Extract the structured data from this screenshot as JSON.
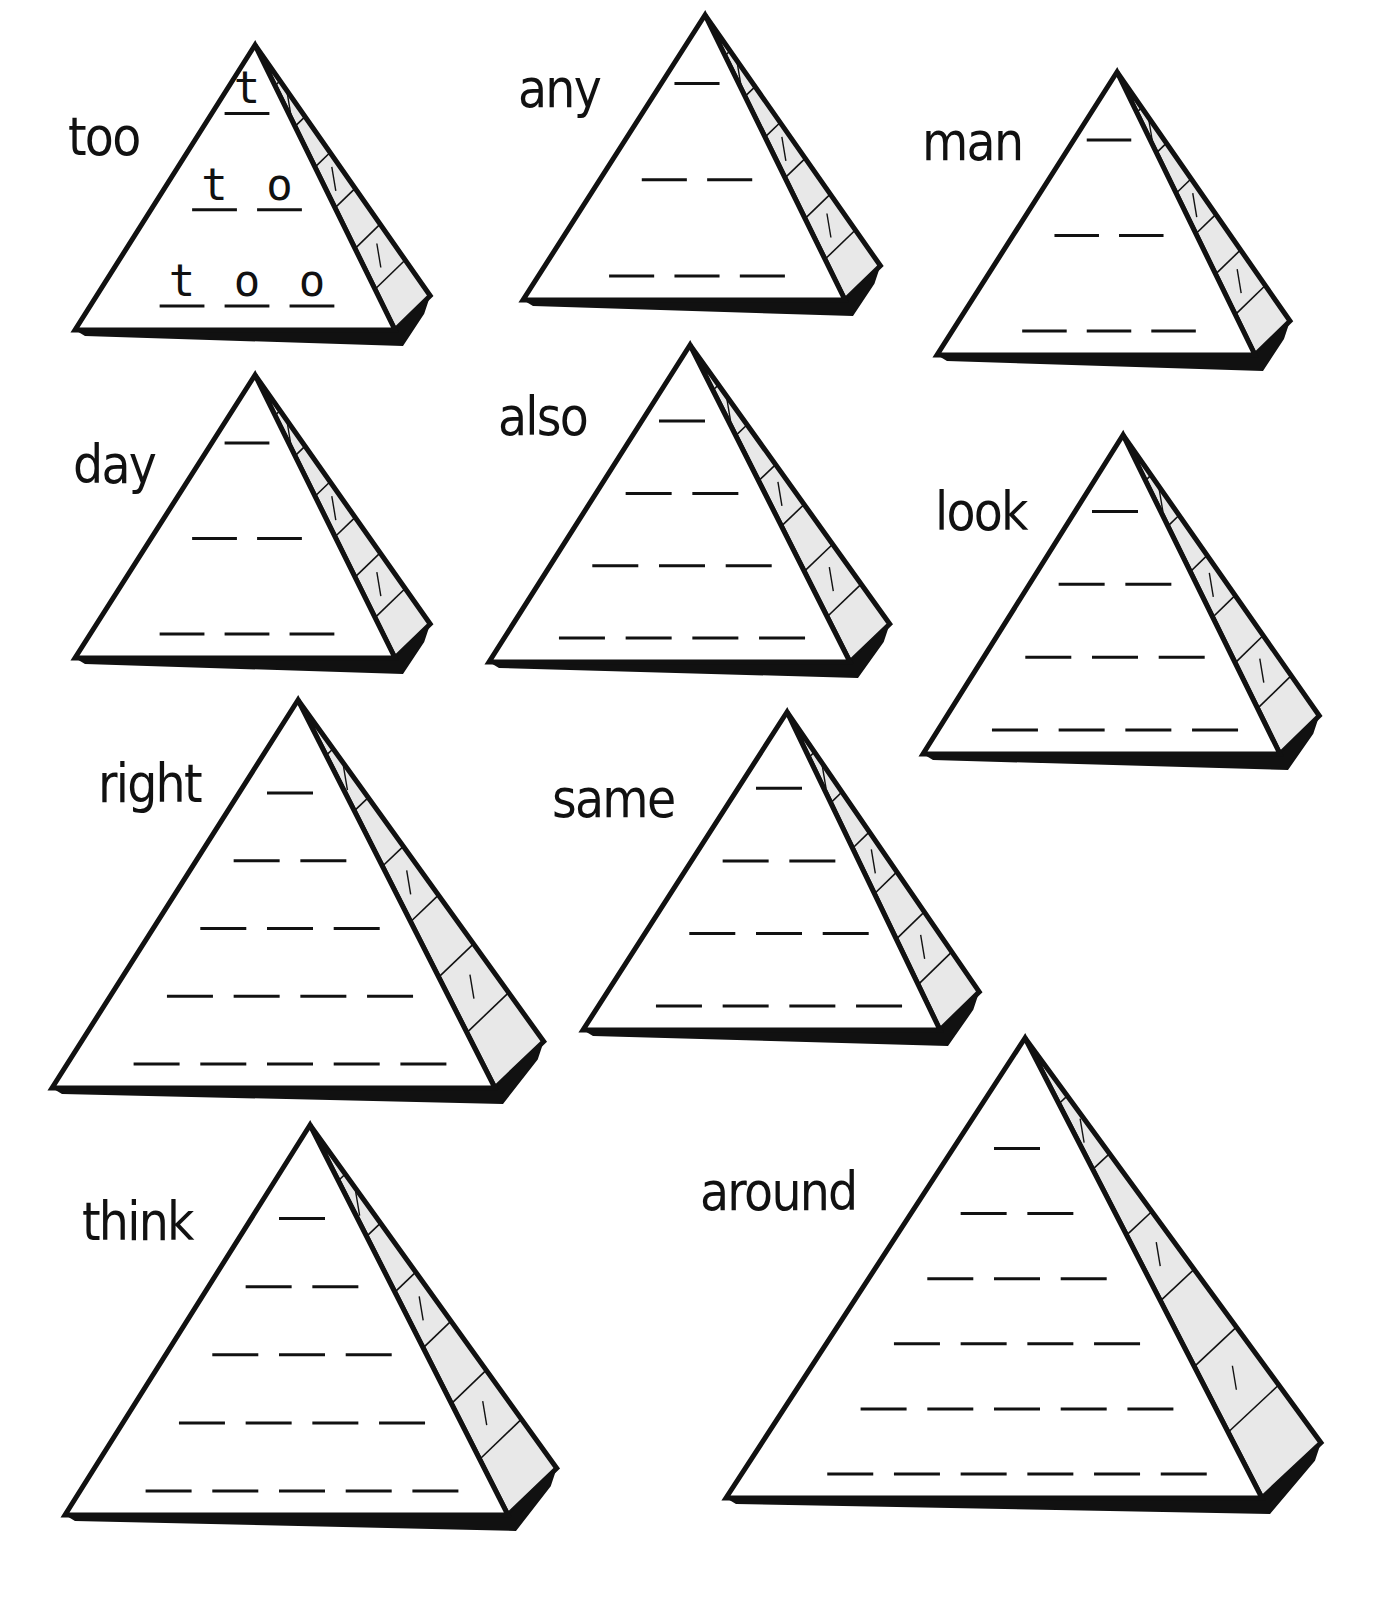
{
  "worksheet": {
    "pyramids": [
      {
        "word": "too",
        "rows": 3,
        "example": [
          [
            "t"
          ],
          [
            "t",
            "o"
          ],
          [
            "t",
            "o",
            "o"
          ]
        ],
        "apex": [
          255,
          45
        ],
        "base_left": [
          75,
          330
        ],
        "base_right": [
          395,
          330
        ],
        "scale": 1,
        "label_pos": [
          68,
          110
        ]
      },
      {
        "word": "any",
        "rows": 3,
        "apex": [
          705,
          15
        ],
        "base_left": [
          523,
          300
        ],
        "base_right": [
          845,
          300
        ],
        "label_pos": [
          518,
          62
        ]
      },
      {
        "word": "man",
        "rows": 3,
        "apex": [
          1117,
          72
        ],
        "base_left": [
          937,
          355
        ],
        "base_right": [
          1255,
          355
        ],
        "label_pos": [
          922,
          115
        ]
      },
      {
        "word": "day",
        "rows": 3,
        "apex": [
          255,
          375
        ],
        "base_left": [
          75,
          658
        ],
        "base_right": [
          395,
          658
        ],
        "label_pos": [
          73,
          438
        ]
      },
      {
        "word": "also",
        "rows": 4,
        "apex": [
          690,
          345
        ],
        "base_left": [
          489,
          662
        ],
        "base_right": [
          850,
          662
        ],
        "label_pos": [
          498,
          390
        ]
      },
      {
        "word": "look",
        "rows": 4,
        "apex": [
          1123,
          435
        ],
        "base_left": [
          923,
          754
        ],
        "base_right": [
          1280,
          754
        ],
        "label_pos": [
          935,
          485
        ]
      },
      {
        "word": "right",
        "rows": 5,
        "apex": [
          298,
          700
        ],
        "base_left": [
          52,
          1088
        ],
        "base_right": [
          495,
          1088
        ],
        "label_pos": [
          98,
          757
        ]
      },
      {
        "word": "same",
        "rows": 4,
        "apex": [
          787,
          712
        ],
        "base_left": [
          583,
          1030
        ],
        "base_right": [
          940,
          1030
        ],
        "label_pos": [
          552,
          772
        ]
      },
      {
        "word": "think",
        "rows": 5,
        "apex": [
          310,
          1125
        ],
        "base_left": [
          65,
          1515
        ],
        "base_right": [
          508,
          1515
        ],
        "label_pos": [
          82,
          1195
        ]
      },
      {
        "word": "around",
        "rows": 6,
        "apex": [
          1025,
          1038
        ],
        "base_left": [
          726,
          1498
        ],
        "base_right": [
          1262,
          1498
        ],
        "label_pos": [
          700,
          1165
        ]
      }
    ]
  }
}
